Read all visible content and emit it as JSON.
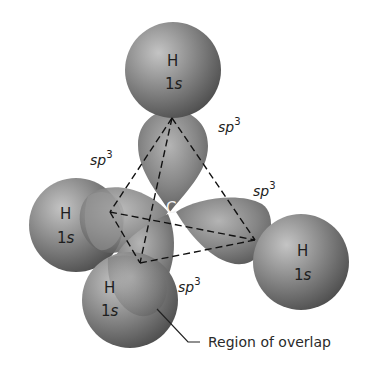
{
  "diagram": {
    "central_atom": {
      "label": "C",
      "x": 172,
      "y": 212
    },
    "hydrogens": [
      {
        "id": "top",
        "element": "H",
        "orbital_prefix": "1",
        "orbital_suffix": "s",
        "cx": 173,
        "cy": 70,
        "r": 48
      },
      {
        "id": "left",
        "element": "H",
        "orbital_prefix": "1",
        "orbital_suffix": "s",
        "cx": 76,
        "cy": 225,
        "r": 47
      },
      {
        "id": "right",
        "element": "H",
        "orbital_prefix": "1",
        "orbital_suffix": "s",
        "cx": 301,
        "cy": 262,
        "r": 48
      },
      {
        "id": "bottom",
        "element": "H",
        "orbital_prefix": "1",
        "orbital_suffix": "s",
        "cx": 130,
        "cy": 300,
        "r": 48
      }
    ],
    "hybrid_labels": [
      {
        "id": "top",
        "base": "sp",
        "sup": "3",
        "x": 222,
        "y": 128
      },
      {
        "id": "left",
        "base": "sp",
        "sup": "3",
        "x": 90,
        "y": 165
      },
      {
        "id": "right",
        "base": "sp",
        "sup": "3",
        "x": 252,
        "y": 196
      },
      {
        "id": "bottom",
        "base": "sp",
        "sup": "3",
        "x": 178,
        "y": 292
      }
    ],
    "tetrahedron_vertices": {
      "top": [
        172,
        118
      ],
      "left": [
        110,
        212
      ],
      "right": [
        255,
        240
      ],
      "bottom": [
        140,
        263
      ]
    },
    "annotation": {
      "text": "Region of overlap"
    },
    "colors": {
      "sphere_light": "#b9b9b9",
      "sphere_mid": "#8a8a8a",
      "sphere_dark": "#4a4a4a",
      "background": "#ffffff"
    }
  }
}
